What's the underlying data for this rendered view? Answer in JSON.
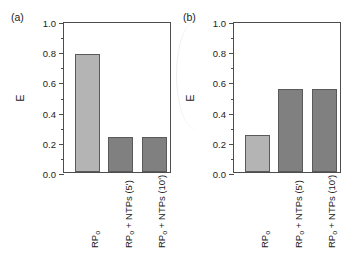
{
  "figure": {
    "background": "#ffffff",
    "bar_color_light": "#b4b4b4",
    "bar_color_dark": "#808080",
    "bar_edge_color": "#5a5a5a",
    "axis_color": "#4d4d4d"
  },
  "panels": [
    {
      "label": "(a)",
      "ylabel": "E"
    },
    {
      "label": "(b)",
      "ylabel": "E"
    }
  ],
  "axis": {
    "ytick_labels": [
      "1.0",
      "0.8",
      "0.6",
      "0.4",
      "0.2",
      "0.0"
    ],
    "ytick_values": [
      1.0,
      0.8,
      0.6,
      0.4,
      0.2,
      0.0
    ],
    "yminor_values": [
      0.9,
      0.7,
      0.5,
      0.3,
      0.1
    ]
  },
  "categories_html": [
    "RP<sub>o</sub>",
    "RP<sub>o</sub> + NTPs (5')",
    "RP<sub>o</sub> + NTPs (10')"
  ],
  "chart_data": [
    {
      "type": "bar",
      "title": "(a)",
      "categories": [
        "RPo",
        "RPo + NTPs (5')",
        "RPo + NTPs (10')"
      ],
      "values": [
        0.78,
        0.23,
        0.23
      ],
      "colors": [
        "#b4b4b4",
        "#808080",
        "#808080"
      ],
      "xlabel": "",
      "ylabel": "E",
      "ylim": [
        0.0,
        1.0
      ],
      "yticks": [
        0.0,
        0.2,
        0.4,
        0.6,
        0.8,
        1.0
      ],
      "yminor_ticks": [
        0.1,
        0.3,
        0.5,
        0.7,
        0.9
      ],
      "grid": false,
      "legend": "none"
    },
    {
      "type": "bar",
      "title": "(b)",
      "categories": [
        "RPo",
        "RPo + NTPs (5')",
        "RPo + NTPs (10')"
      ],
      "values": [
        0.245,
        0.55,
        0.55
      ],
      "colors": [
        "#b4b4b4",
        "#808080",
        "#808080"
      ],
      "xlabel": "",
      "ylabel": "E",
      "ylim": [
        0.0,
        1.0
      ],
      "yticks": [
        0.0,
        0.2,
        0.4,
        0.6,
        0.8,
        1.0
      ],
      "yminor_ticks": [
        0.1,
        0.3,
        0.5,
        0.7,
        0.9
      ],
      "grid": false,
      "legend": "none"
    }
  ]
}
